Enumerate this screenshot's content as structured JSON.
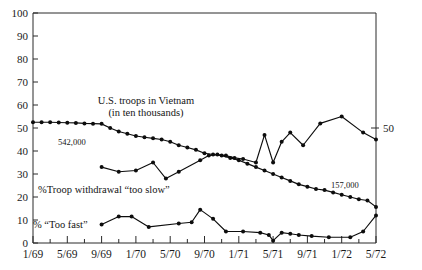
{
  "chart_data": {
    "type": "line",
    "title": "",
    "xlabel": "",
    "ylabel": "",
    "ylim": [
      0,
      100
    ],
    "ytick_step": 10,
    "yticks": [
      "0",
      "10",
      "20",
      "30",
      "40",
      "50",
      "60",
      "70",
      "80",
      "90",
      "100"
    ],
    "xticks": [
      "1/69",
      "5/69",
      "9/69",
      "1/70",
      "5/70",
      "9/70",
      "1/71",
      "5/71",
      "9/71",
      "1/72",
      "5/72"
    ],
    "x_minor_tick_interval_months": 2,
    "x_range": [
      "1/69",
      "5/72"
    ],
    "grid": false,
    "legend": "inline-annotations",
    "right_axis_labels": [
      "50"
    ],
    "annotations": [
      {
        "name": "troops-label",
        "text": "U.S. troops in Vietnam"
      },
      {
        "name": "troops-sublabel",
        "text": "(in ten thousands)"
      },
      {
        "name": "troops-start-value",
        "text": "542,000"
      },
      {
        "name": "troops-end-value",
        "text": "157,000"
      },
      {
        "name": "too-slow-label",
        "text": "%Troop withdrawal “too slow”"
      },
      {
        "name": "too-fast-label",
        "text": "% “Too fast”"
      },
      {
        "name": "right-axis-value",
        "text": "50"
      }
    ],
    "series": [
      {
        "name": "U.S. troops in Vietnam (in ten thousands)",
        "color": "#0d0d0d",
        "points": [
          {
            "x": 0.0,
            "y": 52.5
          },
          {
            "x": 1.0,
            "y": 52.5
          },
          {
            "x": 2.0,
            "y": 52.5
          },
          {
            "x": 3.0,
            "y": 52.4
          },
          {
            "x": 4.0,
            "y": 52.3
          },
          {
            "x": 5.0,
            "y": 52.2
          },
          {
            "x": 6.0,
            "y": 52.0
          },
          {
            "x": 7.0,
            "y": 51.9
          },
          {
            "x": 8.0,
            "y": 51.8
          },
          {
            "x": 9.0,
            "y": 50.0
          },
          {
            "x": 10.0,
            "y": 48.5
          },
          {
            "x": 11.0,
            "y": 47.5
          },
          {
            "x": 12.0,
            "y": 46.5
          },
          {
            "x": 13.0,
            "y": 46.0
          },
          {
            "x": 14.0,
            "y": 45.5
          },
          {
            "x": 15.0,
            "y": 45.0
          },
          {
            "x": 16.0,
            "y": 44.0
          },
          {
            "x": 17.0,
            "y": 42.5
          },
          {
            "x": 18.0,
            "y": 41.5
          },
          {
            "x": 19.0,
            "y": 40.5
          },
          {
            "x": 20.0,
            "y": 39.0
          },
          {
            "x": 21.0,
            "y": 38.5
          },
          {
            "x": 22.0,
            "y": 38.0
          },
          {
            "x": 23.0,
            "y": 37.0
          },
          {
            "x": 24.0,
            "y": 36.0
          },
          {
            "x": 25.0,
            "y": 34.5
          },
          {
            "x": 26.0,
            "y": 33.0
          },
          {
            "x": 27.0,
            "y": 31.5
          },
          {
            "x": 28.0,
            "y": 30.0
          },
          {
            "x": 29.0,
            "y": 28.5
          },
          {
            "x": 30.0,
            "y": 27.0
          },
          {
            "x": 31.0,
            "y": 25.5
          },
          {
            "x": 32.0,
            "y": 24.5
          },
          {
            "x": 33.0,
            "y": 23.5
          },
          {
            "x": 34.0,
            "y": 23.0
          },
          {
            "x": 35.0,
            "y": 22.0
          },
          {
            "x": 36.0,
            "y": 21.0
          },
          {
            "x": 37.0,
            "y": 20.0
          },
          {
            "x": 38.0,
            "y": 19.0
          },
          {
            "x": 39.0,
            "y": 18.5
          },
          {
            "x": 40.0,
            "y": 15.7
          }
        ]
      },
      {
        "name": "%Troop withdrawal “too slow”",
        "color": "#0d0d0d",
        "points": [
          {
            "x": 8.0,
            "y": 33.0
          },
          {
            "x": 10.0,
            "y": 31.0
          },
          {
            "x": 12.0,
            "y": 31.5
          },
          {
            "x": 14.0,
            "y": 35.0
          },
          {
            "x": 15.5,
            "y": 28.0
          },
          {
            "x": 17.0,
            "y": 31.0
          },
          {
            "x": 19.5,
            "y": 36.0
          },
          {
            "x": 20.5,
            "y": 38.0
          },
          {
            "x": 21.5,
            "y": 38.5
          },
          {
            "x": 22.5,
            "y": 38.0
          },
          {
            "x": 23.5,
            "y": 37.0
          },
          {
            "x": 24.5,
            "y": 36.5
          },
          {
            "x": 26.0,
            "y": 35.0
          },
          {
            "x": 27.0,
            "y": 47.0
          },
          {
            "x": 28.0,
            "y": 35.0
          },
          {
            "x": 29.0,
            "y": 44.0
          },
          {
            "x": 30.0,
            "y": 48.0
          },
          {
            "x": 31.5,
            "y": 42.5
          },
          {
            "x": 33.5,
            "y": 52.0
          },
          {
            "x": 36.0,
            "y": 55.0
          },
          {
            "x": 38.5,
            "y": 48.0
          },
          {
            "x": 40.0,
            "y": 45.0
          }
        ]
      },
      {
        "name": "% “Too fast”",
        "color": "#0d0d0d",
        "points": [
          {
            "x": 8.0,
            "y": 8.0
          },
          {
            "x": 10.0,
            "y": 11.5
          },
          {
            "x": 11.5,
            "y": 11.5
          },
          {
            "x": 13.5,
            "y": 7.0
          },
          {
            "x": 17.0,
            "y": 8.5
          },
          {
            "x": 18.5,
            "y": 9.0
          },
          {
            "x": 19.5,
            "y": 14.5
          },
          {
            "x": 21.0,
            "y": 10.5
          },
          {
            "x": 22.5,
            "y": 5.0
          },
          {
            "x": 24.5,
            "y": 5.0
          },
          {
            "x": 26.5,
            "y": 4.5
          },
          {
            "x": 27.5,
            "y": 3.5
          },
          {
            "x": 28.0,
            "y": 1.0
          },
          {
            "x": 29.0,
            "y": 4.5
          },
          {
            "x": 30.0,
            "y": 4.0
          },
          {
            "x": 31.0,
            "y": 3.5
          },
          {
            "x": 32.5,
            "y": 3.0
          },
          {
            "x": 34.5,
            "y": 2.5
          },
          {
            "x": 37.0,
            "y": 2.5
          },
          {
            "x": 38.5,
            "y": 5.0
          },
          {
            "x": 40.0,
            "y": 12.0
          }
        ]
      }
    ]
  }
}
